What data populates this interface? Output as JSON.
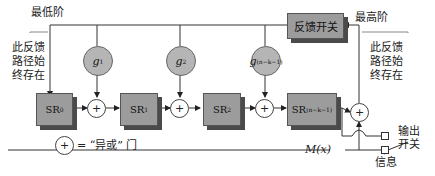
{
  "diagram": {
    "labels": {
      "lowest_order": "最低阶",
      "highest_order": "最高阶",
      "left_note": [
        "此反馈",
        "路径始",
        "终存在"
      ],
      "right_note": [
        "此反馈",
        "路径始",
        "终存在"
      ],
      "feedback_switch": "反馈开关",
      "xor_legend_symbol": "+",
      "xor_legend_text": "= “异或” 门",
      "output_switch": [
        "输出",
        "开关"
      ],
      "info": "信息",
      "message_input": "M(x)"
    },
    "registers": [
      {
        "name": "SR",
        "sub": "0"
      },
      {
        "name": "SR",
        "sub": "1"
      },
      {
        "name": "SR",
        "sub": "2"
      },
      {
        "name": "SR",
        "sub": "(n−k−1)"
      }
    ],
    "taps": [
      {
        "name": "g",
        "sub": "1"
      },
      {
        "name": "g",
        "sub": "2"
      },
      {
        "name": "g",
        "sub": "(n−k−1)"
      }
    ],
    "xor_symbol": "+",
    "colors": {
      "block_fill": "#9c9c9c",
      "block_shadow": "#4a4a4a",
      "tap_fill": "#b5b5b5",
      "line": "#333333",
      "leader_line": "#888888"
    }
  }
}
